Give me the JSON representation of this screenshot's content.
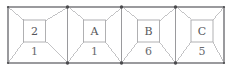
{
  "figure": {
    "kind": "chain-of-boxes-diagram",
    "outer_border_color": "#9a9a9d",
    "diagonal_color": "#b4b4b7",
    "inner_box_border_color": "#a8a8ab",
    "vertex_dot_color": "#4a4a4d",
    "background_color": "#ffffff",
    "geometry": {
      "left": 8,
      "right": 224,
      "top": 7,
      "bottom": 63,
      "dividers": [
        67.5,
        121.5,
        175.5
      ],
      "inner_box_width": 22,
      "inner_box_height": 22,
      "inner_box_center_y": 31,
      "weight_label_y": 52
    },
    "cells": [
      {
        "label": "2",
        "weight": "1",
        "x_left": 8,
        "x_right": 67.5,
        "inner_center_x": 34.5
      },
      {
        "label": "A",
        "weight": "1",
        "x_left": 67.5,
        "x_right": 121.5,
        "inner_center_x": 94.5
      },
      {
        "label": "B",
        "weight": "6",
        "x_left": 121.5,
        "x_right": 175.5,
        "inner_center_x": 148.5
      },
      {
        "label": "C",
        "weight": "5",
        "x_left": 175.5,
        "x_right": 224,
        "inner_center_x": 202
      }
    ]
  },
  "chart_data": {
    "type": "diagram",
    "title": "",
    "categories": [
      "2",
      "A",
      "B",
      "C"
    ],
    "values": [
      1,
      1,
      6,
      5
    ],
    "series": [
      {
        "name": "weight",
        "values": [
          1,
          1,
          6,
          5
        ]
      }
    ],
    "labels": [
      "2",
      "A",
      "B",
      "C"
    ],
    "xlabel": "",
    "ylabel": ""
  }
}
